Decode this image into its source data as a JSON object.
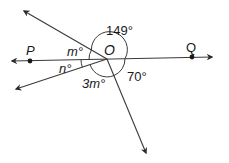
{
  "diagram": {
    "type": "angles-at-a-point",
    "center_point": {
      "label": "O",
      "x": 107,
      "y": 59
    },
    "points": [
      {
        "label": "P",
        "x": 30,
        "y": 61
      },
      {
        "label": "Q",
        "x": 192,
        "y": 57
      }
    ],
    "rays": [
      {
        "name": "ray-upper-left",
        "end": [
          24,
          11
        ]
      },
      {
        "name": "ray-left-through-P",
        "end": [
          12,
          61
        ]
      },
      {
        "name": "ray-right-through-Q",
        "end": [
          212,
          57
        ]
      },
      {
        "name": "ray-lower-left",
        "end": [
          16,
          89
        ]
      },
      {
        "name": "ray-down-right",
        "end": [
          146,
          153
        ]
      }
    ],
    "angle_labels": {
      "top": "149°",
      "m": "m°",
      "n": "n°",
      "three_m": "3m°",
      "seventy": "70°"
    },
    "stroke_color": "#3a3a3a",
    "text_color": "#1a1a1a"
  }
}
